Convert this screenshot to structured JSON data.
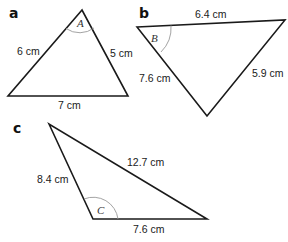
{
  "diagram": {
    "type": "triangle-exercises",
    "triangles": [
      {
        "part": "a",
        "angle_label": "A",
        "sides": {
          "left": "6 cm",
          "right": "5 cm",
          "bottom": "7 cm"
        }
      },
      {
        "part": "b",
        "angle_label": "B",
        "sides": {
          "top": "6.4 cm",
          "left": "7.6 cm",
          "right": "5.9 cm"
        }
      },
      {
        "part": "c",
        "angle_label": "C",
        "sides": {
          "left": "8.4 cm",
          "hypotenuse": "12.7 cm",
          "bottom": "7.6 cm"
        }
      }
    ]
  }
}
